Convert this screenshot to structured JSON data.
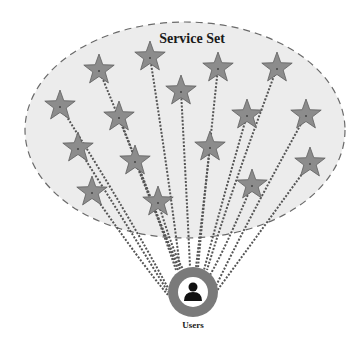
{
  "diagram": {
    "title": "Service Set",
    "users_label": "Users",
    "colors": {
      "ellipse_fill": "#ececec",
      "ellipse_stroke": "#6a6a6a",
      "star_fill": "#8c8c8c",
      "star_stroke": "#5e5e5e",
      "link": "#555555",
      "user_ring": "#7a7a7a",
      "user_inner": "#ffffff",
      "user_icon": "#111111"
    },
    "ellipse": {
      "cx": 185,
      "cy": 130,
      "rx": 160,
      "ry": 108
    },
    "user_node": {
      "cx": 193,
      "cy": 292,
      "r_outer": 25,
      "r_inner": 15
    },
    "services": [
      {
        "id": "s1",
        "x": 150,
        "y": 57,
        "anchor": [
          180,
          268
        ]
      },
      {
        "id": "s2",
        "x": 99,
        "y": 70,
        "anchor": [
          176,
          270
        ]
      },
      {
        "id": "s3",
        "x": 218,
        "y": 68,
        "anchor": [
          198,
          268
        ]
      },
      {
        "id": "s4",
        "x": 277,
        "y": 68,
        "anchor": [
          207,
          270
        ]
      },
      {
        "id": "s5",
        "x": 181,
        "y": 91,
        "anchor": [
          190,
          267
        ]
      },
      {
        "id": "s6",
        "x": 60,
        "y": 106,
        "anchor": [
          168,
          288
        ]
      },
      {
        "id": "s7",
        "x": 119,
        "y": 117,
        "anchor": [
          178,
          270
        ]
      },
      {
        "id": "s8",
        "x": 247,
        "y": 115,
        "anchor": [
          204,
          270
        ]
      },
      {
        "id": "s9",
        "x": 306,
        "y": 115,
        "anchor": [
          215,
          288
        ]
      },
      {
        "id": "s10",
        "x": 78,
        "y": 148,
        "anchor": [
          168,
          292
        ]
      },
      {
        "id": "s11",
        "x": 135,
        "y": 161,
        "anchor": [
          180,
          269
        ]
      },
      {
        "id": "s12",
        "x": 210,
        "y": 147,
        "anchor": [
          196,
          267
        ]
      },
      {
        "id": "s13",
        "x": 310,
        "y": 163,
        "anchor": [
          216,
          292
        ]
      },
      {
        "id": "s14",
        "x": 92,
        "y": 192,
        "anchor": [
          168,
          295
        ]
      },
      {
        "id": "s15",
        "x": 158,
        "y": 202,
        "anchor": [
          183,
          269
        ]
      },
      {
        "id": "s16",
        "x": 252,
        "y": 185,
        "anchor": [
          210,
          275
        ]
      }
    ]
  }
}
